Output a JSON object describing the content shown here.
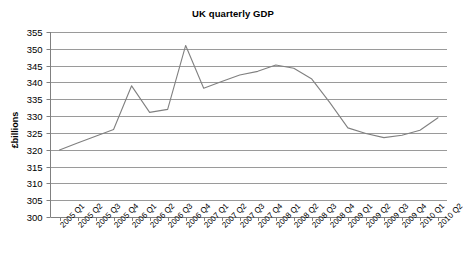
{
  "chart_data": {
    "type": "line",
    "title": "UK quarterly GDP",
    "xlabel": "",
    "ylabel": "£billions",
    "ylim": [
      300,
      355
    ],
    "y_ticks": [
      300,
      305,
      310,
      315,
      320,
      325,
      330,
      335,
      340,
      345,
      350,
      355
    ],
    "grid": true,
    "legend": "none",
    "line_color": "#808080",
    "categories": [
      "2005 Q1",
      "2005 Q2",
      "2005 Q3",
      "2005 Q4",
      "2006 Q1",
      "2006 Q2",
      "2006 Q3",
      "2006 Q4",
      "2007 Q1",
      "2007 Q2",
      "2007 Q3",
      "2007 Q4",
      "2008 Q1",
      "2008 Q2",
      "2008 Q3",
      "2008 Q4",
      "2009 Q1",
      "2009 Q2",
      "2009 Q3",
      "2009 Q4",
      "2010 Q1",
      "2010 Q2"
    ],
    "values": [
      319.9,
      322.0,
      324.0,
      326.0,
      339.0,
      331.1,
      332.0,
      351.0,
      338.3,
      340.3,
      342.2,
      343.3,
      345.2,
      344.2,
      341.0,
      334.0,
      326.5,
      324.8,
      323.6,
      324.3,
      325.8,
      329.5
    ]
  }
}
